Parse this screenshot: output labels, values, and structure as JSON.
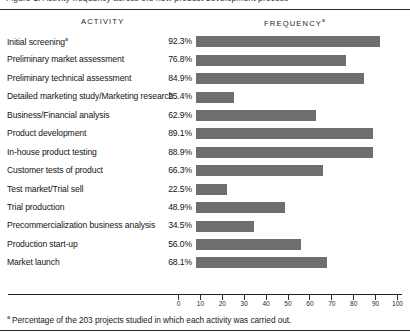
{
  "caption_partial": "Figure  1.   Activity  frequency  across  the  new  product  development  process",
  "header": {
    "activity_label": "ACTIVITY",
    "frequency_label": "FREQUENCY",
    "frequency_footnote_marker": "a"
  },
  "footnote": {
    "marker": "a",
    "text": "Percentage of the 203 projects studied in which each activity was carried out."
  },
  "colors": {
    "bar": "#6e6e6e",
    "rule": "#2b2b2b",
    "text": "#141414",
    "background": "#ffffff"
  },
  "chart_data": {
    "type": "bar",
    "xlabel": "",
    "ylabel": "",
    "xlim": [
      0,
      100
    ],
    "grid": false,
    "orientation": "horizontal",
    "legend": "none",
    "tick_labels": [
      "0",
      "10",
      "20",
      "30",
      "40",
      "50",
      "60",
      "70",
      "80",
      "90",
      "100"
    ],
    "ticks": [
      0,
      10,
      20,
      30,
      40,
      50,
      60,
      70,
      80,
      90,
      100
    ],
    "value_suffix": "%",
    "categories": [
      "Initial screening",
      "Preliminary market assessment",
      "Preliminary technical assessment",
      "Detailed marketing study/Marketing research",
      "Business/Financial analysis",
      "Product development",
      "In-house product testing",
      "Customer tests of product",
      "Test market/Trial sell",
      "Trial production",
      "Precommercialization business analysis",
      "Production start-up",
      "Market launch"
    ],
    "values": [
      92.3,
      76.8,
      84.9,
      25.4,
      62.9,
      89.1,
      88.9,
      66.3,
      22.5,
      48.9,
      34.5,
      56.0,
      68.1
    ],
    "value_labels": [
      "92.3%",
      "76.8%",
      "84.9%",
      "25.4%",
      "62.9%",
      "89.1%",
      "88.9%",
      "66.3%",
      "22.5%",
      "48.9%",
      "34.5%",
      "56.0%",
      "68.1%"
    ],
    "category_footnote_markers": [
      "a",
      "",
      "",
      "",
      "",
      "",
      "",
      "",
      "",
      "",
      "",
      "",
      ""
    ]
  }
}
